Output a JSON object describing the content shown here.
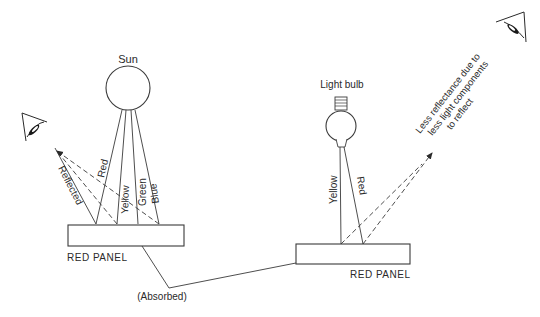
{
  "diagram": {
    "left_scene": {
      "source_label": "Sun",
      "rays": [
        {
          "label": "Red"
        },
        {
          "label": "Yellow"
        },
        {
          "label": "Green"
        },
        {
          "label": "Blue"
        }
      ],
      "reflected_label": "Reflected",
      "panel_label": "RED PANEL"
    },
    "right_scene": {
      "source_label": "Light bulb",
      "rays": [
        {
          "label": "Yellow"
        },
        {
          "label": "Red"
        }
      ],
      "annotation_lines": [
        "Less reflectance due to",
        "less light components",
        "to reflect"
      ],
      "panel_label": "RED PANEL"
    },
    "absorbed_label": "(Absorbed)",
    "colors": {
      "line": "#3a3a3a",
      "text": "#2a2a2a",
      "background": "#ffffff"
    }
  }
}
